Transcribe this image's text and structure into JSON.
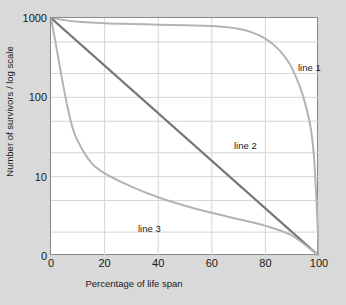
{
  "chart_data": {
    "type": "line",
    "title": "",
    "xlabel": "Percentage of life span",
    "ylabel": "Number of survivors / log scale",
    "yscale": "log",
    "xlim": [
      0,
      100
    ],
    "ylim": [
      1,
      1000
    ],
    "grid": true,
    "legend_position": "inline-annotations",
    "xticks": [
      "0",
      "20",
      "40",
      "60",
      "80",
      "100"
    ],
    "xtick_values": [
      0,
      20,
      40,
      60,
      80,
      100
    ],
    "yticks": [
      "1000",
      "100",
      "10",
      "0"
    ],
    "ytick_values": [
      1000,
      100,
      10,
      1
    ],
    "series": [
      {
        "name": "line 1",
        "label": "line 1",
        "color": "#b3b3b3",
        "annotation": "line 1",
        "x": [
          0,
          5,
          10,
          20,
          30,
          40,
          50,
          60,
          65,
          70,
          75,
          80,
          85,
          90,
          95,
          98,
          100
        ],
        "values": [
          1000,
          940,
          900,
          860,
          840,
          825,
          810,
          790,
          770,
          730,
          660,
          550,
          400,
          230,
          80,
          20,
          1
        ]
      },
      {
        "name": "line 2",
        "label": "line 2",
        "color": "#777777",
        "annotation": "line 2",
        "x": [
          0,
          10,
          20,
          30,
          40,
          50,
          60,
          70,
          80,
          90,
          100
        ],
        "values": [
          1000,
          500,
          251,
          126,
          63,
          32,
          16,
          8,
          4,
          2,
          1
        ]
      },
      {
        "name": "line 3",
        "label": "line 3",
        "color": "#b3b3b3",
        "annotation": "line 3",
        "x": [
          0,
          2,
          4,
          6,
          8,
          10,
          15,
          20,
          30,
          40,
          50,
          60,
          70,
          80,
          90,
          100
        ],
        "values": [
          1000,
          430,
          180,
          80,
          42,
          28,
          15,
          11,
          7.5,
          5.5,
          4.3,
          3.5,
          2.9,
          2.4,
          1.8,
          1
        ]
      }
    ]
  },
  "annotations": {
    "line1": {
      "text": "line 1",
      "left": "247px",
      "top": "44px"
    },
    "line2": {
      "text": "line 2",
      "left": "183px",
      "top": "122px"
    },
    "line3": {
      "text": "line 3",
      "left": "87px",
      "top": "205px"
    }
  }
}
